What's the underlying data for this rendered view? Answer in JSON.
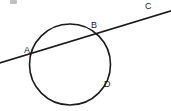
{
  "figure": {
    "kind": "geometry-diagram",
    "canvas": {
      "width": 171,
      "height": 111,
      "background": "#ffffff"
    },
    "stroke_color": "#1a1a1a",
    "circle": {
      "cx": 70,
      "cy": 64.5,
      "r": 40.5,
      "stroke_width": 1.6
    },
    "secant": {
      "x1": -2,
      "y1": 63.5,
      "x2": 172,
      "y2": 10.5,
      "stroke_width": 1.6
    },
    "labels": {
      "a": "A",
      "b": "B",
      "c": "C",
      "d": "D"
    },
    "points": {
      "a": {
        "x": 33,
        "y": 58
      },
      "b": {
        "x": 97,
        "y": 32
      },
      "c": {
        "x": 160,
        "y": 14
      },
      "d": {
        "x": 101,
        "y": 83
      }
    }
  }
}
